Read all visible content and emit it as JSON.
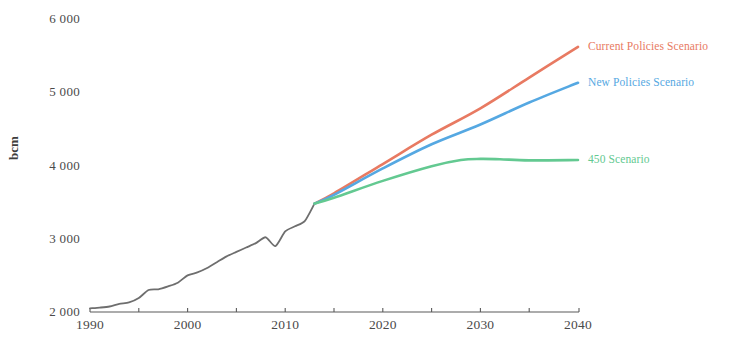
{
  "chart_data": {
    "type": "line",
    "title": "",
    "xlabel": "",
    "ylabel": "bcm",
    "xlim": [
      1990,
      2040
    ],
    "ylim": [
      2000,
      6000
    ],
    "grid": false,
    "legend_position": "inline-right",
    "x_ticks": [
      "1990",
      "2000",
      "2010",
      "2020",
      "2030",
      "2040"
    ],
    "x_tick_values": [
      1990,
      2000,
      2010,
      2020,
      2030,
      2040
    ],
    "x_minor_tick_values": [
      1995,
      2005,
      2015,
      2025,
      2035
    ],
    "y_ticks": [
      "2 000",
      "3 000",
      "4 000",
      "5 000",
      "6 000"
    ],
    "y_tick_values": [
      2000,
      3000,
      4000,
      5000,
      6000
    ],
    "series": [
      {
        "name": "Historical",
        "color": "#6e6e6e",
        "label_shown": false,
        "x": [
          1990,
          1991,
          1992,
          1993,
          1994,
          1995,
          1996,
          1997,
          1998,
          1999,
          2000,
          2001,
          2002,
          2003,
          2004,
          2005,
          2006,
          2007,
          2008,
          2009,
          2010,
          2011,
          2012,
          2013
        ],
        "values": [
          2050,
          2060,
          2075,
          2110,
          2130,
          2190,
          2300,
          2310,
          2350,
          2400,
          2500,
          2540,
          2600,
          2680,
          2760,
          2820,
          2880,
          2940,
          3020,
          2900,
          3100,
          3170,
          3240,
          3480
        ]
      },
      {
        "name": "Current Policies Scenario",
        "color": "#e87a62",
        "label_shown": true,
        "x": [
          2013,
          2015,
          2020,
          2025,
          2030,
          2035,
          2040
        ],
        "values": [
          3480,
          3620,
          4020,
          4420,
          4780,
          5200,
          5620
        ]
      },
      {
        "name": "New Policies Scenario",
        "color": "#55a8e2",
        "label_shown": true,
        "x": [
          2013,
          2015,
          2020,
          2025,
          2030,
          2035,
          2040
        ],
        "values": [
          3480,
          3600,
          3960,
          4290,
          4560,
          4860,
          5130
        ]
      },
      {
        "name": "450 Scenario",
        "color": "#63c991",
        "label_shown": true,
        "x": [
          2013,
          2015,
          2020,
          2025,
          2028,
          2030,
          2032,
          2035,
          2040
        ],
        "values": [
          3480,
          3560,
          3790,
          3990,
          4075,
          4090,
          4085,
          4070,
          4075
        ]
      }
    ],
    "annotations": [
      {
        "text": "Current Policies Scenario",
        "color": "#e87a62",
        "x": 2040,
        "y": 5620
      },
      {
        "text": "New Policies Scenario",
        "color": "#55a8e2",
        "x": 2040,
        "y": 5130
      },
      {
        "text": "450 Scenario",
        "color": "#63c991",
        "x": 2040,
        "y": 4075
      }
    ],
    "axis_color": "#5a5a5a"
  }
}
